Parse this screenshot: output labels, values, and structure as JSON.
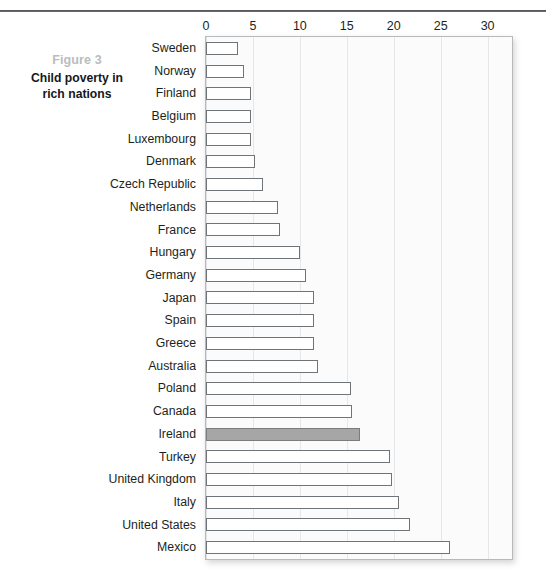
{
  "caption": {
    "figure_number": "Figure 3",
    "title_line1": "Child poverty in",
    "title_line2": "rich nations"
  },
  "colors": {
    "bar_fill": "#ffffff",
    "bar_stroke": "#6f7478",
    "highlight_fill": "#a6a6a6",
    "gridline": "#cfd2d5",
    "figure_number_color": "#b9bcc0",
    "title_color": "#16181a",
    "top_rule": "#3c4044"
  },
  "chart_data": {
    "type": "bar",
    "orientation": "horizontal",
    "title": "Child poverty in rich nations",
    "subtitle": "Figure 3",
    "xlabel": "",
    "ylabel": "",
    "xlim": [
      0,
      32.6
    ],
    "grid": true,
    "legend": false,
    "xticks": [
      0,
      5,
      10,
      15,
      20,
      25,
      30
    ],
    "xtick_labels": [
      "0",
      "5",
      "10",
      "15",
      "20",
      "25",
      "30"
    ],
    "highlight_category": "Ireland",
    "categories": [
      "Sweden",
      "Norway",
      "Finland",
      "Belgium",
      "Luxembourg",
      "Denmark",
      "Czech Republic",
      "Netherlands",
      "France",
      "Hungary",
      "Germany",
      "Japan",
      "Spain",
      "Greece",
      "Australia",
      "Poland",
      "Canada",
      "Ireland",
      "Turkey",
      "United Kingdom",
      "Italy",
      "United States",
      "Mexico"
    ],
    "values": [
      3.4,
      4.1,
      4.8,
      4.8,
      4.8,
      5.2,
      6.1,
      7.7,
      7.9,
      10.0,
      10.7,
      11.5,
      11.5,
      11.5,
      11.9,
      15.4,
      15.6,
      16.4,
      19.6,
      19.8,
      20.6,
      21.7,
      26.0
    ]
  }
}
